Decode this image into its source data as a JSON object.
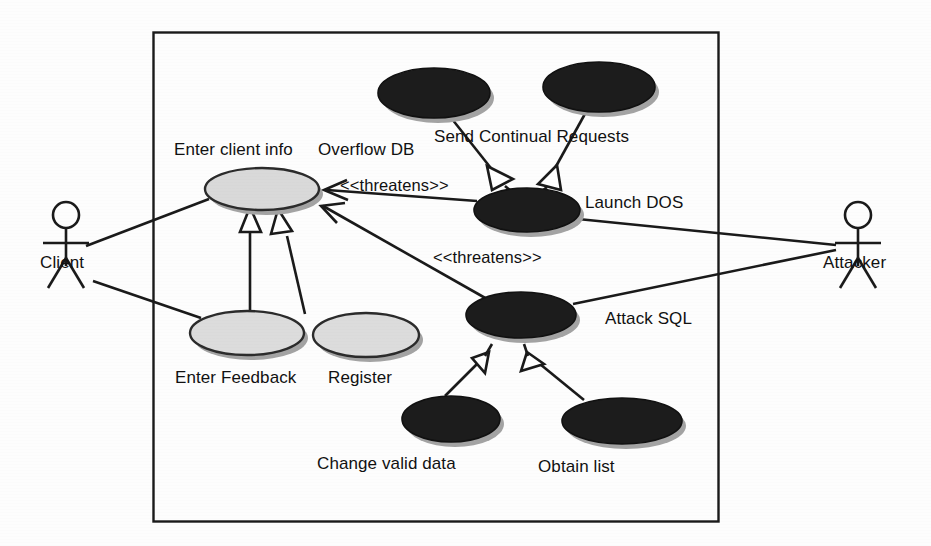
{
  "diagram": {
    "type": "uml-use-case-diagram",
    "title": "",
    "system_boundary": {
      "label": "",
      "x": 153,
      "y": 32,
      "width": 565,
      "height": 489
    },
    "colors": {
      "normal_use_case_fill": "#d9d9d9",
      "misuse_case_fill": "#1c1c1c",
      "stroke": "#1a1a1a",
      "shadow": "#9a9a9a",
      "background": "#fdfdfd",
      "text": "#111111"
    },
    "actors": [
      {
        "id": "client",
        "name": "Client",
        "x": 66,
        "y": 218
      },
      {
        "id": "attacker",
        "name": "Attacker",
        "x": 858,
        "y": 218
      }
    ],
    "use_cases": [
      {
        "id": "enter-client-info",
        "label": "Enter client info",
        "kind": "use-case",
        "fill": "#d9d9d9",
        "cx": 262,
        "cy": 189,
        "rx": 57,
        "ry": 21,
        "label_x": 174,
        "label_y": 140
      },
      {
        "id": "enter-feedback",
        "label": "Enter Feedback",
        "kind": "use-case",
        "fill": "#d9d9d9",
        "cx": 247,
        "cy": 333,
        "rx": 57,
        "ry": 22,
        "label_x": 175,
        "label_y": 368
      },
      {
        "id": "register",
        "label": "Register",
        "kind": "use-case",
        "fill": "#d9d9d9",
        "cx": 366,
        "cy": 335,
        "rx": 53,
        "ry": 22,
        "label_x": 328,
        "label_y": 368
      },
      {
        "id": "overflow-db",
        "label": "Overflow DB",
        "kind": "misuse-case",
        "fill": "#1c1c1c",
        "cx": 434,
        "cy": 93,
        "rx": 56,
        "ry": 25,
        "label_x": 318,
        "label_y": 140
      },
      {
        "id": "send-continual-requests",
        "label": "Send Continual Requests",
        "kind": "misuse-case",
        "fill": "#1c1c1c",
        "cx": 599,
        "cy": 87,
        "rx": 56,
        "ry": 25,
        "label_x": 434,
        "label_y": 127
      },
      {
        "id": "launch-dos",
        "label": "Launch DOS",
        "kind": "misuse-case",
        "fill": "#1c1c1c",
        "cx": 527,
        "cy": 210,
        "rx": 53,
        "ry": 22,
        "label_x": 585,
        "label_y": 193
      },
      {
        "id": "attack-sql",
        "label": "Attack SQL",
        "kind": "misuse-case",
        "fill": "#1c1c1c",
        "cx": 521,
        "cy": 315,
        "rx": 55,
        "ry": 23,
        "label_x": 605,
        "label_y": 309
      },
      {
        "id": "change-valid-data",
        "label": "Change valid data",
        "kind": "misuse-case",
        "fill": "#1c1c1c",
        "cx": 451,
        "cy": 419,
        "rx": 49,
        "ry": 23,
        "label_x": 317,
        "label_y": 454
      },
      {
        "id": "obtain-list",
        "label": "Obtain list",
        "kind": "misuse-case",
        "fill": "#1c1c1c",
        "cx": 622,
        "cy": 421,
        "rx": 60,
        "ry": 23,
        "label_x": 538,
        "label_y": 457
      }
    ],
    "relationship_labels": [
      {
        "id": "threatens-1",
        "text": "<<threatens>>",
        "x": 340,
        "y": 176
      },
      {
        "id": "threatens-2",
        "text": "<<threatens>>",
        "x": 433,
        "y": 248
      }
    ],
    "associations": [
      {
        "id": "client-to-enter-client-info",
        "from": "client",
        "to": "enter-client-info",
        "kind": "association"
      },
      {
        "id": "client-to-enter-feedback",
        "from": "client",
        "to": "enter-feedback",
        "kind": "association"
      },
      {
        "id": "attacker-to-launch-dos",
        "from": "attacker",
        "to": "launch-dos",
        "kind": "association"
      },
      {
        "id": "attacker-to-attack-sql",
        "from": "attacker",
        "to": "attack-sql",
        "kind": "association"
      }
    ],
    "generalizations": [
      {
        "id": "overflow-db-to-launch-dos",
        "from": "overflow-db",
        "to": "launch-dos"
      },
      {
        "id": "send-continual-requests-to-launch-dos",
        "from": "send-continual-requests",
        "to": "launch-dos"
      },
      {
        "id": "change-valid-data-to-attack-sql",
        "from": "change-valid-data",
        "to": "attack-sql"
      },
      {
        "id": "obtain-list-to-attack-sql",
        "from": "obtain-list",
        "to": "attack-sql"
      },
      {
        "id": "enter-feedback-to-enter-client-info",
        "from": "enter-feedback",
        "to": "enter-client-info"
      },
      {
        "id": "register-to-enter-client-info",
        "from": "register",
        "to": "enter-client-info"
      }
    ],
    "threatens_links": [
      {
        "id": "launch-dos-threatens-enter-client-info",
        "from": "launch-dos",
        "to": "enter-client-info",
        "label": "<<threatens>>"
      },
      {
        "id": "attack-sql-threatens-enter-client-info",
        "from": "attack-sql",
        "to": "enter-client-info",
        "label": "<<threatens>>"
      }
    ]
  }
}
